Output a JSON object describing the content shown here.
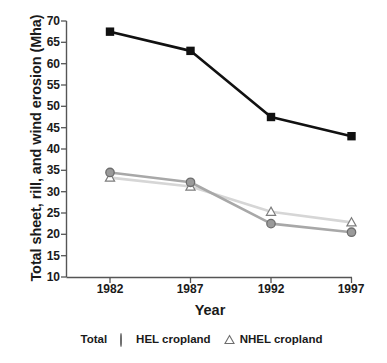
{
  "chart_data": {
    "type": "line",
    "title": "",
    "xlabel": "Year",
    "ylabel": "Total sheet, rill, and wind erosion (Mha)",
    "categories": [
      "1982",
      "1987",
      "1992",
      "1997"
    ],
    "x": [
      1982,
      1987,
      1992,
      1997
    ],
    "xlim": [
      1979.5,
      1999.5
    ],
    "ylim": [
      10,
      70
    ],
    "yticks": [
      10,
      15,
      20,
      25,
      30,
      35,
      40,
      45,
      50,
      55,
      60,
      65,
      70
    ],
    "ytick_labels": [
      "10",
      "15",
      "20",
      "25",
      "30",
      "35",
      "40",
      "45",
      "50",
      "55",
      "60",
      "65",
      "70"
    ],
    "xtick_labels": [
      "1982",
      "1987",
      "1992",
      "1997"
    ],
    "grid": false,
    "legend_position": "below",
    "series": [
      {
        "name": "Total",
        "marker": "filled-square",
        "color": "#111111",
        "values": [
          67.5,
          63.0,
          47.5,
          43.0
        ]
      },
      {
        "name": "HEL cropland",
        "marker": "filled-circle",
        "color": "#9a9a9a",
        "values": [
          34.5,
          32.2,
          22.5,
          20.5
        ]
      },
      {
        "name": "NHEL cropland",
        "marker": "open-triangle",
        "color": "#d6d6d6",
        "values": [
          33.3,
          31.2,
          25.3,
          22.8
        ]
      }
    ]
  },
  "legend": {
    "items": [
      {
        "label": "Total",
        "marker": "filled-square"
      },
      {
        "label": "HEL cropland",
        "marker": "filled-circle"
      },
      {
        "label": "NHEL cropland",
        "marker": "open-triangle"
      }
    ]
  },
  "colors": {
    "total": "#111111",
    "hel": "#9a9a9a",
    "hel_edge": "#6d6d6d",
    "nhel": "#d6d6d6",
    "nhel_edge": "#8f8f8f",
    "axis": "#555555",
    "background": "#ffffff"
  }
}
